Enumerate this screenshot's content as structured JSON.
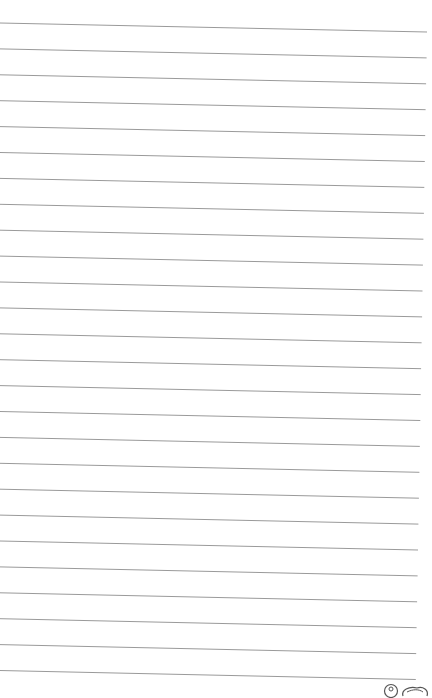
{
  "page": {
    "type": "lined-notebook-page",
    "background": "#ffffff",
    "line_color": "#9a9a9a",
    "line_count": 26,
    "first_line_y": 23,
    "line_spacing": 25.9,
    "slope_px": 9
  },
  "footer": {
    "icons": [
      "circle-logo-icon",
      "cloud-logo-icon"
    ]
  }
}
